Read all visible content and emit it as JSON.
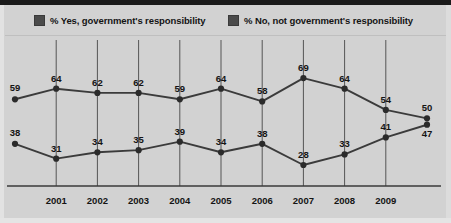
{
  "legend": {
    "items": [
      {
        "label": "% Yes, government's responsibility",
        "color": "#4b4b4b",
        "swatch": "legend-swatch-yes"
      },
      {
        "label": "% No, not government's responsibility",
        "color": "#4b4b4b",
        "swatch": "legend-swatch-no"
      }
    ]
  },
  "colors": {
    "background": "#d2d2d2",
    "top_band": "#1a1a1a",
    "line": "#3b3b3b",
    "marker": "#2b2b2b",
    "gridline": "#555555",
    "axis": "#3a3a3a",
    "label_text": "#141414"
  },
  "chart_data": {
    "type": "line",
    "title": "",
    "subtitle": "",
    "xlabel": "",
    "ylabel": "",
    "grid": true,
    "grid_orientation": "vertical",
    "legend_position": "top",
    "ylim": [
      0,
      75
    ],
    "x_tick_labels": [
      "2001",
      "2002",
      "2003",
      "2004",
      "2005",
      "2006",
      "2007",
      "2008",
      "2009"
    ],
    "x_tick_positions": [
      1,
      2,
      3,
      4,
      5,
      6,
      7,
      8,
      9
    ],
    "x_points": [
      0,
      1,
      2,
      3,
      4,
      5,
      6,
      7,
      8,
      9,
      10
    ],
    "series": [
      {
        "name": "% Yes, government's responsibility",
        "values": [
          59,
          64,
          62,
          62,
          59,
          64,
          58,
          69,
          64,
          54,
          50
        ],
        "label_side": "above"
      },
      {
        "name": "% No, not government's responsibility",
        "values": [
          38,
          31,
          34,
          35,
          39,
          34,
          38,
          28,
          33,
          41,
          47
        ],
        "label_side": "above"
      }
    ],
    "annotations": [
      {
        "text": "50",
        "series": 0,
        "index": 10,
        "note": "final Yes value"
      },
      {
        "text": "47",
        "series": 1,
        "index": 10,
        "note": "final No value, label below point"
      }
    ]
  }
}
